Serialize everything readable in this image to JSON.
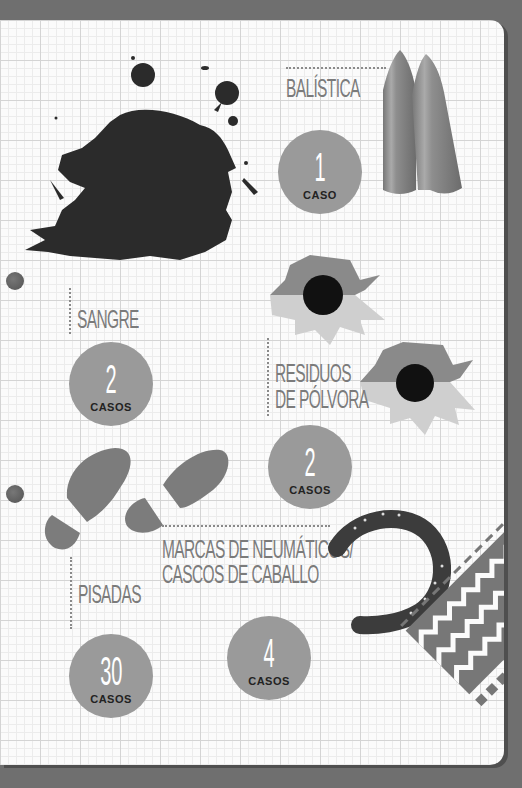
{
  "infographic": {
    "sections": [
      {
        "id": "balistica",
        "title": "BALÍSTICA",
        "count": "1",
        "unit": "CASO",
        "icon": "bullets-icon"
      },
      {
        "id": "sangre",
        "title": "SANGRE",
        "count": "2",
        "unit": "CASOS",
        "icon": "blood-splatter-icon"
      },
      {
        "id": "residuos",
        "title_lines": [
          "RESIDUOS",
          "DE PÓLVORA"
        ],
        "count": "2",
        "unit": "CASOS",
        "icon": "bullet-hole-icon"
      },
      {
        "id": "pisadas",
        "title": "PISADAS",
        "count": "30",
        "unit": "CASOS",
        "icon": "footprints-icon"
      },
      {
        "id": "marcas",
        "title_lines": [
          "MARCAS DE NEUMÁTICOS/",
          "CASCOS DE CABALLO"
        ],
        "count": "4",
        "unit": "CASOS",
        "icon": "horseshoe-icon"
      }
    ],
    "colors": {
      "background": "#6f6f6f",
      "paper": "#fbfbfb",
      "badge": "#9a9a9a",
      "ink": "#2b2b2b",
      "label": "#7b7b7b"
    }
  }
}
